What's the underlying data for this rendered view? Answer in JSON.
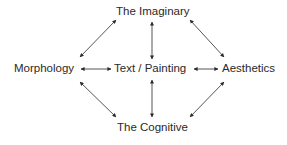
{
  "diagram": {
    "nodes": {
      "top": "The Imaginary",
      "left": "Morphology",
      "center": "Text / Painting",
      "right": "Aesthetics",
      "bottom": "The Cognitive"
    },
    "edges": [
      {
        "from": "left",
        "to": "top",
        "type": "bidirectional"
      },
      {
        "from": "center",
        "to": "top",
        "type": "bidirectional"
      },
      {
        "from": "right",
        "to": "top",
        "type": "bidirectional"
      },
      {
        "from": "left",
        "to": "center",
        "type": "bidirectional"
      },
      {
        "from": "center",
        "to": "right",
        "type": "bidirectional"
      },
      {
        "from": "left",
        "to": "bottom",
        "type": "bidirectional"
      },
      {
        "from": "center",
        "to": "bottom",
        "type": "bidirectional"
      },
      {
        "from": "right",
        "to": "bottom",
        "type": "bidirectional"
      }
    ],
    "color": "#2a2a2a"
  }
}
